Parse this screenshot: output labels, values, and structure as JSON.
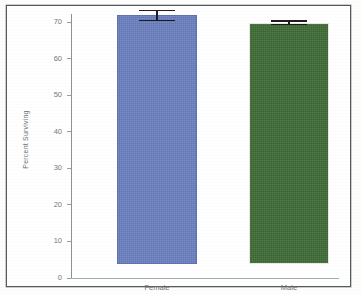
{
  "chart_data": {
    "type": "bar",
    "title": "",
    "subtitle": "",
    "xlabel": "",
    "ylabel": "Percent Surviving",
    "categories": [
      "Female",
      "Male"
    ],
    "values": [
      68,
      66
    ],
    "errors": [
      1.5,
      0.6
    ],
    "series": [
      {
        "name": "Percent Surviving",
        "values": [
          68,
          66
        ],
        "errors": [
          1.5,
          0.6
        ]
      }
    ],
    "bar_colors": [
      "#6b7fc0",
      "#3d6b35"
    ],
    "error_bar_color": "#1d1d1d",
    "ylim": [
      0,
      72
    ],
    "yticks": [
      0,
      10,
      20,
      30,
      40,
      50,
      60,
      70
    ],
    "ytick_labels": [
      "0",
      "10",
      "20",
      "30",
      "40",
      "50",
      "60",
      "70"
    ],
    "grid": false,
    "legend": false,
    "legend_position": "none",
    "axis_color": "#8d9295",
    "tick_label_color": "#75797b",
    "frame_color": "#555a5c",
    "background_color": "#ffffff"
  },
  "figure": {
    "border_color": "#555a5c",
    "page_background": "#fdfdfc"
  }
}
